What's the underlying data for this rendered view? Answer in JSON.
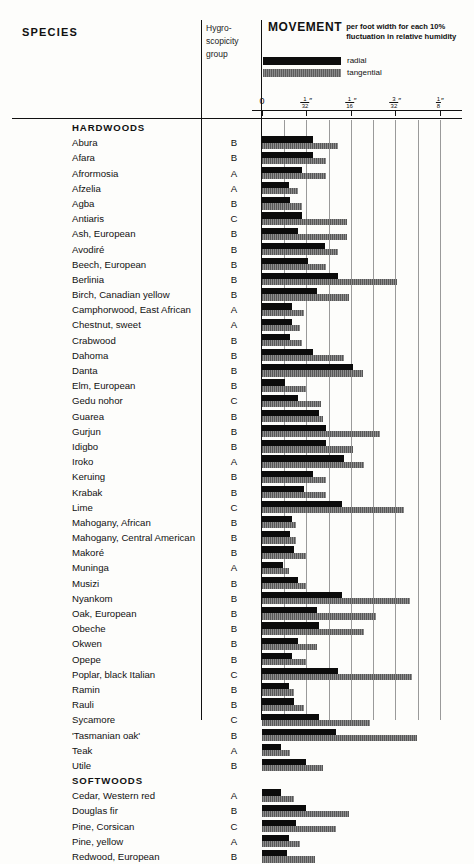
{
  "header": {
    "species_title": "SPECIES",
    "hygro_lines": [
      "Hygro-",
      "scopicity",
      "group"
    ],
    "movement_word": "MOVEMENT",
    "movement_sub": "per foot width for each 10% fluctuation in relative humidity",
    "legend": [
      {
        "key": "radial",
        "label": "radial"
      },
      {
        "key": "tangential",
        "label": "tangential"
      }
    ]
  },
  "axis": {
    "unit": "inch",
    "ticks": [
      {
        "label": "0",
        "num": "",
        "den": "",
        "value": 0
      },
      {
        "label": "",
        "num": "1",
        "den": "32",
        "value": 0.03125
      },
      {
        "label": "",
        "num": "1",
        "den": "16",
        "value": 0.0625
      },
      {
        "label": "",
        "num": "3",
        "den": "32",
        "value": 0.09375
      },
      {
        "label": "",
        "num": "1",
        "den": "8",
        "value": 0.125
      }
    ],
    "xmin": 0,
    "xmax": 0.1406,
    "minor_gridlines": 9
  },
  "colors": {
    "radial": "#0b0b0b",
    "tangential": "#6b6b6b",
    "rule": "#111111",
    "grid": "#9a9a9a",
    "page": "#fdfdfb"
  },
  "chart_data": {
    "type": "bar",
    "xlabel": "inches",
    "ylabel": "Species",
    "xlim": [
      0,
      0.1406
    ],
    "grid": true,
    "legend_position": "top",
    "units": "inches per foot width",
    "series": [
      {
        "name": "radial",
        "color": "#0b0b0b"
      },
      {
        "name": "tangential",
        "color": "#6b6b6b"
      }
    ],
    "columns": [
      "species",
      "hygroscopicity_group",
      "radial",
      "tangential"
    ],
    "rows": [
      {
        "species": "HARDWOODS",
        "group": "",
        "radial": null,
        "tangential": null,
        "is_group": true
      },
      {
        "species": "Abura",
        "group": "B",
        "radial": 0.036,
        "tangential": 0.0533
      },
      {
        "species": "Afara",
        "group": "B",
        "radial": 0.036,
        "tangential": 0.0453
      },
      {
        "species": "Afrormosia",
        "group": "A",
        "radial": 0.028,
        "tangential": 0.0453
      },
      {
        "species": "Afzelia",
        "group": "A",
        "radial": 0.0187,
        "tangential": 0.0253
      },
      {
        "species": "Agba",
        "group": "B",
        "radial": 0.02,
        "tangential": 0.028
      },
      {
        "species": "Antiaris",
        "group": "C",
        "radial": 0.028,
        "tangential": 0.06
      },
      {
        "species": "Ash, European",
        "group": "B",
        "radial": 0.0253,
        "tangential": 0.06
      },
      {
        "species": "Avodiré",
        "group": "B",
        "radial": 0.044,
        "tangential": 0.0533
      },
      {
        "species": "Beech, European",
        "group": "B",
        "radial": 0.032,
        "tangential": 0.0453
      },
      {
        "species": "Berlinia",
        "group": "B",
        "radial": 0.0533,
        "tangential": 0.0947
      },
      {
        "species": "Birch, Canadian yellow",
        "group": "B",
        "radial": 0.0387,
        "tangential": 0.0613
      },
      {
        "species": "Camphorwood, East African",
        "group": "A",
        "radial": 0.0213,
        "tangential": 0.0293
      },
      {
        "species": "Chestnut, sweet",
        "group": "A",
        "radial": 0.0213,
        "tangential": 0.0267
      },
      {
        "species": "Crabwood",
        "group": "B",
        "radial": 0.02,
        "tangential": 0.028
      },
      {
        "species": "Dahoma",
        "group": "B",
        "radial": 0.036,
        "tangential": 0.0573
      },
      {
        "species": "Danta",
        "group": "B",
        "radial": 0.064,
        "tangential": 0.0707
      },
      {
        "species": "Elm, European",
        "group": "B",
        "radial": 0.016,
        "tangential": 0.0307
      },
      {
        "species": "Gedu nohor",
        "group": "C",
        "radial": 0.0253,
        "tangential": 0.0413
      },
      {
        "species": "Guarea",
        "group": "B",
        "radial": 0.04,
        "tangential": 0.0427
      },
      {
        "species": "Gurjun",
        "group": "B",
        "radial": 0.0453,
        "tangential": 0.0827
      },
      {
        "species": "Idigbo",
        "group": "B",
        "radial": 0.0453,
        "tangential": 0.064
      },
      {
        "species": "Iroko",
        "group": "A",
        "radial": 0.0573,
        "tangential": 0.072
      },
      {
        "species": "Keruing",
        "group": "B",
        "radial": 0.036,
        "tangential": 0.0453
      },
      {
        "species": "Krabak",
        "group": "B",
        "radial": 0.0293,
        "tangential": 0.0453
      },
      {
        "species": "Lime",
        "group": "C",
        "radial": 0.056,
        "tangential": 0.1
      },
      {
        "species": "Mahogany, African",
        "group": "B",
        "radial": 0.0213,
        "tangential": 0.024
      },
      {
        "species": "Mahogany, Central American",
        "group": "B",
        "radial": 0.02,
        "tangential": 0.024
      },
      {
        "species": "Makoré",
        "group": "B",
        "radial": 0.0227,
        "tangential": 0.0307
      },
      {
        "species": "Muninga",
        "group": "A",
        "radial": 0.0147,
        "tangential": 0.0187
      },
      {
        "species": "Musizi",
        "group": "B",
        "radial": 0.0253,
        "tangential": 0.0307
      },
      {
        "species": "Nyankom",
        "group": "B",
        "radial": 0.056,
        "tangential": 0.104
      },
      {
        "species": "Oak, European",
        "group": "B",
        "radial": 0.0387,
        "tangential": 0.08
      },
      {
        "species": "Obeche",
        "group": "B",
        "radial": 0.04,
        "tangential": 0.072
      },
      {
        "species": "Okwen",
        "group": "B",
        "radial": 0.0253,
        "tangential": 0.0387
      },
      {
        "species": "Opepe",
        "group": "B",
        "radial": 0.0213,
        "tangential": 0.0307
      },
      {
        "species": "Poplar, black Italian",
        "group": "C",
        "radial": 0.0533,
        "tangential": 0.1053
      },
      {
        "species": "Ramin",
        "group": "B",
        "radial": 0.0187,
        "tangential": 0.0227
      },
      {
        "species": "Rauli",
        "group": "B",
        "radial": 0.0227,
        "tangential": 0.0293
      },
      {
        "species": "Sycamore",
        "group": "C",
        "radial": 0.04,
        "tangential": 0.076
      },
      {
        "species": "'Tasmanian oak'",
        "group": "B",
        "radial": 0.052,
        "tangential": 0.1093
      },
      {
        "species": "Teak",
        "group": "A",
        "radial": 0.0133,
        "tangential": 0.02
      },
      {
        "species": "Utile",
        "group": "B",
        "radial": 0.0307,
        "tangential": 0.0427
      },
      {
        "species": "SOFTWOODS",
        "group": "",
        "radial": null,
        "tangential": null,
        "is_group": true
      },
      {
        "species": "Cedar, Western red",
        "group": "A",
        "radial": 0.0133,
        "tangential": 0.0227
      },
      {
        "species": "Douglas fir",
        "group": "B",
        "radial": 0.0307,
        "tangential": 0.0613
      },
      {
        "species": "Pine, Corsican",
        "group": "C",
        "radial": 0.024,
        "tangential": 0.052
      },
      {
        "species": "Pine, yellow",
        "group": "A",
        "radial": 0.0187,
        "tangential": 0.0267
      },
      {
        "species": "Redwood, European",
        "group": "B",
        "radial": 0.0173,
        "tangential": 0.0373
      }
    ]
  }
}
